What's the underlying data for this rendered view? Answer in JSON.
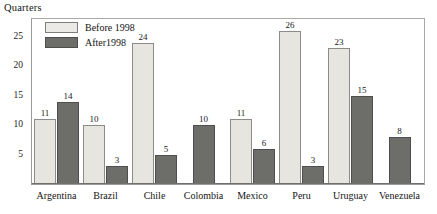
{
  "chart_data": {
    "type": "bar",
    "title": "",
    "ylabel": "Quarters",
    "xlabel": "",
    "ylim": [
      0,
      28
    ],
    "yticks": [
      5,
      10,
      15,
      20,
      25
    ],
    "grid": false,
    "legend_position": "top-left",
    "categories": [
      "Argentina",
      "Brazil",
      "Chile",
      "Colombia",
      "Mexico",
      "Peru",
      "Uruguay",
      "Venezuela"
    ],
    "series": [
      {
        "name": "Before 1998",
        "color": "#e7e5e0",
        "values": [
          11,
          10,
          24,
          null,
          11,
          26,
          23,
          null
        ]
      },
      {
        "name": "After1998",
        "color": "#6d6d6a",
        "values": [
          14,
          3,
          5,
          10,
          6,
          3,
          15,
          8
        ]
      }
    ],
    "bars": [
      {
        "category": "Argentina",
        "items": [
          {
            "series": "Before 1998",
            "value": 11,
            "label": "11",
            "style": "before"
          },
          {
            "series": "After1998",
            "value": 14,
            "label": "14",
            "style": "after"
          }
        ]
      },
      {
        "category": "Brazil",
        "items": [
          {
            "series": "Before 1998",
            "value": 10,
            "label": "10",
            "style": "before"
          },
          {
            "series": "After1998",
            "value": 3,
            "label": "3",
            "style": "after"
          }
        ]
      },
      {
        "category": "Chile",
        "items": [
          {
            "series": "Before 1998",
            "value": 24,
            "label": "24",
            "style": "before"
          },
          {
            "series": "After1998",
            "value": 5,
            "label": "5",
            "style": "after"
          }
        ]
      },
      {
        "category": "Colombia",
        "items": [
          {
            "series": "After1998",
            "value": 10,
            "label": "10",
            "style": "after"
          }
        ]
      },
      {
        "category": "Mexico",
        "items": [
          {
            "series": "Before 1998",
            "value": 11,
            "label": "11",
            "style": "before"
          },
          {
            "series": "After1998",
            "value": 6,
            "label": "6",
            "style": "after"
          }
        ]
      },
      {
        "category": "Peru",
        "items": [
          {
            "series": "Before 1998",
            "value": 26,
            "label": "26",
            "style": "before"
          },
          {
            "series": "After1998",
            "value": 3,
            "label": "3",
            "style": "after"
          }
        ]
      },
      {
        "category": "Uruguay",
        "items": [
          {
            "series": "Before 1998",
            "value": 23,
            "label": "23",
            "style": "before"
          },
          {
            "series": "After1998",
            "value": 15,
            "label": "15",
            "style": "after"
          }
        ]
      },
      {
        "category": "Venezuela",
        "items": [
          {
            "series": "After1998",
            "value": 8,
            "label": "8",
            "style": "after"
          }
        ]
      }
    ]
  },
  "legend": {
    "items": [
      {
        "label": "Before 1998",
        "style": "before"
      },
      {
        "label": "After1998",
        "style": "after"
      }
    ]
  }
}
